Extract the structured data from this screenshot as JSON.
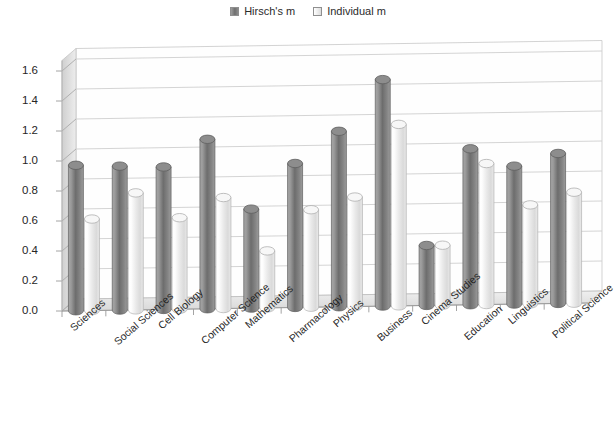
{
  "legend": {
    "position": "top-center",
    "entries": [
      {
        "label": "Hirsch's m",
        "swatch": "series-dark-swatch",
        "color": "#7b7b7b"
      },
      {
        "label": "Individual m",
        "swatch": "series-light-swatch",
        "color": "#eeeeee"
      }
    ]
  },
  "chart_data": {
    "type": "bar",
    "title": "",
    "xlabel": "",
    "ylabel": "",
    "ylim": [
      0.0,
      1.6
    ],
    "ytick_step": 0.2,
    "grid": true,
    "style3d": "cylinder",
    "categories": [
      "Sciences",
      "Social Sciences",
      "Cell Biology",
      "Computer Science",
      "Mathematics",
      "Pharmacology",
      "Physics",
      "Business",
      "Cinema Studies",
      "Education",
      "Linguistics",
      "Political Science"
    ],
    "ytick_labels": [
      "0.0",
      "0.2",
      "0.4",
      "0.6",
      "0.8",
      "1.0",
      "1.2",
      "1.4",
      "1.6"
    ],
    "ytick_values": [
      0.0,
      0.2,
      0.4,
      0.6,
      0.8,
      1.0,
      1.2,
      1.4,
      1.6
    ],
    "series": [
      {
        "name": "Hirsch's m",
        "color": "#7b7b7b",
        "values": [
          0.97,
          0.96,
          0.95,
          1.13,
          0.66,
          0.96,
          1.17,
          1.51,
          0.4,
          1.04,
          0.92,
          1.0
        ]
      },
      {
        "name": "Individual m",
        "color": "#eeeeee",
        "values": [
          0.61,
          0.78,
          0.61,
          0.74,
          0.38,
          0.65,
          0.73,
          1.21,
          0.4,
          0.94,
          0.66,
          0.74
        ]
      }
    ]
  },
  "colors": {
    "background": "#ffffff",
    "gridline": "#cfcfcf",
    "axis": "#b4b4b4",
    "floor": "#e6e6e6",
    "wall": "#fefefe",
    "side_wall": "#dcdcdc",
    "text": "#262626"
  }
}
